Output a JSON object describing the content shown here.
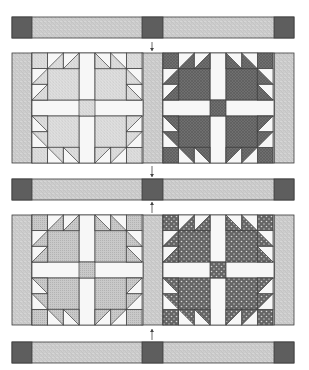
{
  "diagram": {
    "colors": {
      "background": "#ffffff",
      "outline": "#3a3a3a",
      "cornerstone": "#5e5e5e",
      "sashing_light": "#c4c4c4",
      "sashing_speckle": "#e6e6e6",
      "white": "#f7f7f7",
      "arrow": "#444444"
    },
    "strips": [
      {
        "id": "top-sashing-strip",
        "y": 17
      },
      {
        "id": "middle-sashing-strip",
        "y": 179
      },
      {
        "id": "bottom-sashing-strip",
        "y": 342
      }
    ],
    "strip_layout": {
      "x": 12,
      "width": 282,
      "height": 21,
      "cornerstone_width": 20,
      "cornerstone_positions": [
        12,
        142,
        274
      ]
    },
    "block_rows": [
      {
        "id": "block-row-1",
        "y": 53,
        "blocks": [
          {
            "id": "block-1",
            "x": 32,
            "print": "#cfcfcf",
            "print_dark": "#a8a8a8",
            "pattern": "speckle"
          },
          {
            "id": "block-2",
            "x": 163,
            "print": "#6f6f6f",
            "print_dark": "#555555",
            "pattern": "crosshatch"
          }
        ]
      },
      {
        "id": "block-row-2",
        "y": 215,
        "blocks": [
          {
            "id": "block-3",
            "x": 32,
            "print": "#c9c9c9",
            "print_dark": "#b3b3b3",
            "pattern": "fine"
          },
          {
            "id": "block-4",
            "x": 163,
            "print": "#656565",
            "print_dark": "#d8d8d8",
            "pattern": "dots"
          }
        ]
      }
    ],
    "row_layout": {
      "height": 110,
      "side_sashing": [
        {
          "x": 12,
          "w": 20
        },
        {
          "x": 142,
          "w": 21
        },
        {
          "x": 274,
          "w": 20
        }
      ]
    },
    "block_layout": {
      "size": 111,
      "paw_size": 47,
      "sash_width": 16,
      "unit": 15.67
    },
    "arrows": [
      {
        "id": "arrow-top-down",
        "x": 152,
        "y1": 42,
        "y2": 51,
        "direction": "down"
      },
      {
        "id": "arrow-mid-down",
        "x": 152,
        "y1": 166,
        "y2": 177,
        "direction": "down"
      },
      {
        "id": "arrow-mid-up",
        "x": 152,
        "y1": 213,
        "y2": 202,
        "direction": "up"
      },
      {
        "id": "arrow-bottom-up",
        "x": 152,
        "y1": 340,
        "y2": 329,
        "direction": "up"
      }
    ]
  }
}
